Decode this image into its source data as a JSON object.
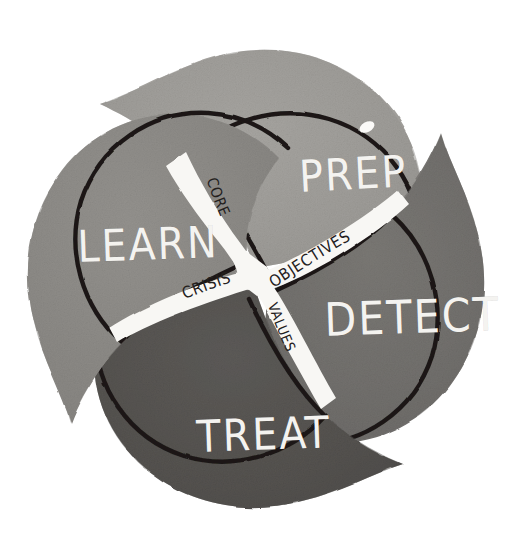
{
  "figure": {
    "style": "hand-drawn watercolor wash, grayscale",
    "background_color": "#ffffff",
    "outline_color": "#1b1916",
    "band_color": "#f7f6f3",
    "label_text_color": "#f4f3f0",
    "band_text_color": "#23201d"
  },
  "quadrants": [
    {
      "id": "prep",
      "label": "PREP",
      "position": "top",
      "fill_color": "#9a9894",
      "wash_color": "#adaba7",
      "rotation_deg": -2
    },
    {
      "id": "detect",
      "label": "DETECT",
      "position": "right",
      "fill_color": "#6f6d6a",
      "wash_color": "#7b7977",
      "rotation_deg": -2
    },
    {
      "id": "treat",
      "label": "TREAT",
      "position": "bottom",
      "fill_color": "#555350",
      "wash_color": "#605e5b",
      "rotation_deg": -2
    },
    {
      "id": "learn",
      "label": "LEARN",
      "position": "left",
      "fill_color": "#8b8986",
      "wash_color": "#979592",
      "rotation_deg": -2
    }
  ],
  "bands": [
    {
      "id": "core",
      "label": "CORE",
      "position": "upper-left-spoke",
      "direction": "reads downward toward center"
    },
    {
      "id": "objectives",
      "label": "OBJECTIVES",
      "position": "upper-right-spoke",
      "direction": "reads outward rising to the right"
    },
    {
      "id": "values",
      "label": "VALUES",
      "position": "lower-right-spoke",
      "direction": "reads downward away from center"
    },
    {
      "id": "crisis",
      "label": "CRISIS",
      "position": "lower-left-spoke",
      "direction": "reads left to right toward center"
    }
  ],
  "center": {
    "description": "Four white bands cross at the middle of the wheel forming an X",
    "combined_phrase": "CORE OBJECTIVES / CRISIS VALUES"
  }
}
